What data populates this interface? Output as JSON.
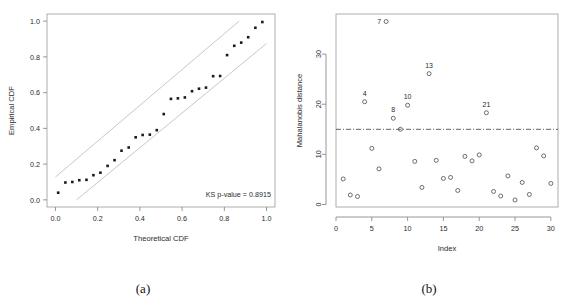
{
  "figure": {
    "panels": [
      {
        "caption": "(a)"
      },
      {
        "caption": "(b)"
      }
    ]
  },
  "chart_data": [
    {
      "type": "scatter",
      "panel": "(a)",
      "title": "",
      "xlabel": "Theoretical CDF",
      "ylabel": "Empirical CDF",
      "xlim": [
        -0.04,
        1.04
      ],
      "ylim": [
        -0.04,
        1.04
      ],
      "xticks": [
        0.0,
        0.2,
        0.4,
        0.6,
        0.8,
        1.0
      ],
      "xticklabels": [
        "0.0",
        "0.2",
        "0.4",
        "0.6",
        "0.8",
        "1.0"
      ],
      "yticks": [
        0.0,
        0.2,
        0.4,
        0.6,
        0.8,
        1.0
      ],
      "yticklabels": [
        "0.0",
        "0.2",
        "0.4",
        "0.6",
        "0.8",
        "1.0"
      ],
      "grid": false,
      "legend": "none",
      "annotation": "KS p-value = 0.8915",
      "series": [
        {
          "name": "ecdf-points",
          "marker": "filled-square",
          "x": [
            0.013,
            0.047,
            0.08,
            0.113,
            0.147,
            0.18,
            0.213,
            0.247,
            0.28,
            0.313,
            0.347,
            0.38,
            0.413,
            0.447,
            0.48,
            0.513,
            0.547,
            0.58,
            0.613,
            0.647,
            0.68,
            0.713,
            0.747,
            0.78,
            0.813,
            0.847,
            0.88,
            0.913,
            0.947,
            0.98
          ],
          "y": [
            0.04,
            0.097,
            0.1,
            0.11,
            0.112,
            0.138,
            0.152,
            0.19,
            0.222,
            0.275,
            0.293,
            0.35,
            0.363,
            0.365,
            0.39,
            0.48,
            0.565,
            0.568,
            0.573,
            0.608,
            0.622,
            0.628,
            0.692,
            0.693,
            0.81,
            0.862,
            0.88,
            0.91,
            0.963,
            0.995
          ]
        },
        {
          "name": "upper-confidence-band",
          "marker": "line",
          "x": [
            0.0,
            0.87
          ],
          "y": [
            0.128,
            1.0
          ]
        },
        {
          "name": "lower-confidence-band",
          "marker": "line",
          "x": [
            0.1,
            1.0
          ],
          "y": [
            0.0,
            0.875
          ]
        }
      ]
    },
    {
      "type": "scatter",
      "panel": "(b)",
      "title": "",
      "xlabel": "Index",
      "ylabel": "Mahalanobis distance",
      "xlim": [
        0.0,
        31.0
      ],
      "ylim": [
        -0.5,
        38.0
      ],
      "xticks": [
        0,
        5,
        10,
        15,
        20,
        25,
        30
      ],
      "xticklabels": [
        "0",
        "5",
        "10",
        "15",
        "20",
        "25",
        "30"
      ],
      "yticks": [
        0,
        10,
        20,
        30
      ],
      "yticklabels": [
        "0",
        "10",
        "20",
        "30"
      ],
      "grid": false,
      "legend": "none",
      "cutoff_line": {
        "value": 15.0,
        "style": "dash-dot",
        "label": ""
      },
      "series": [
        {
          "name": "mahalanobis-distance",
          "marker": "open-circle",
          "x": [
            1,
            2,
            3,
            4,
            5,
            6,
            7,
            8,
            9,
            10,
            11,
            12,
            13,
            14,
            15,
            16,
            17,
            18,
            19,
            20,
            21,
            22,
            23,
            24,
            25,
            26,
            27,
            28,
            29,
            30
          ],
          "y": [
            5.1,
            1.9,
            1.6,
            20.5,
            11.2,
            7.1,
            36.5,
            17.2,
            15.0,
            19.8,
            8.6,
            3.4,
            26.1,
            8.8,
            5.2,
            5.4,
            2.8,
            9.6,
            8.7,
            9.9,
            18.3,
            2.6,
            1.7,
            5.7,
            0.9,
            4.4,
            2.0,
            11.3,
            9.7,
            4.2
          ]
        }
      ],
      "point_labels": [
        {
          "index": 4,
          "text": "4"
        },
        {
          "index": 7,
          "text": "7"
        },
        {
          "index": 8,
          "text": "8"
        },
        {
          "index": 10,
          "text": "10"
        },
        {
          "index": 13,
          "text": "13"
        },
        {
          "index": 21,
          "text": "21"
        }
      ]
    }
  ]
}
